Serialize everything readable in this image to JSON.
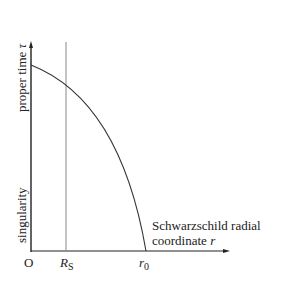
{
  "diagram": {
    "y_axis_label": "proper time",
    "y_axis_symbol": "τ",
    "y_axis_lower_label": "singularity",
    "x_axis_label_line1": "Schwarzschild radial",
    "x_axis_label_line2": "coordinate",
    "x_axis_symbol": "r",
    "origin_label": "O",
    "rs_label": "R",
    "rs_sub": "S",
    "r0_label": "r",
    "r0_sub": "0",
    "colors": {
      "axis": "#222222",
      "curve": "#333333",
      "rs_line": "#888888"
    }
  }
}
